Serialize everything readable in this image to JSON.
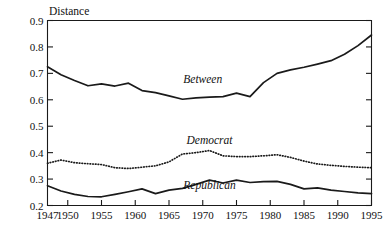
{
  "chart_data": {
    "type": "line",
    "title": "",
    "xlabel": "",
    "ylabel": "Distance",
    "xlim": [
      1947,
      1995
    ],
    "ylim": [
      0.2,
      0.9
    ],
    "grid": false,
    "legend_position": "inline-annotations",
    "x_ticks": [
      1947,
      1950,
      1955,
      1960,
      1965,
      1970,
      1975,
      1980,
      1985,
      1990,
      1995
    ],
    "x_tick_labels": [
      "1947",
      "1950",
      "1955",
      "1960",
      "1965",
      "1970",
      "1975",
      "1980",
      "1985",
      "1990",
      "1995"
    ],
    "y_ticks": [
      0.2,
      0.3,
      0.4,
      0.5,
      0.6,
      0.7,
      0.8,
      0.9
    ],
    "y_tick_labels": [
      "0.2",
      "0.3",
      "0.4",
      "0.5",
      "0.6",
      "0.7",
      "0.8",
      "0.9"
    ],
    "x": [
      1947,
      1949,
      1951,
      1953,
      1955,
      1957,
      1959,
      1961,
      1963,
      1965,
      1967,
      1969,
      1971,
      1973,
      1975,
      1977,
      1979,
      1981,
      1983,
      1985,
      1987,
      1989,
      1991,
      1993,
      1995
    ],
    "series": [
      {
        "name": "Between",
        "style": "solid",
        "color": "#1a1a1a",
        "label_x": 1970,
        "label_y": 0.665,
        "values": [
          0.725,
          0.695,
          0.673,
          0.653,
          0.66,
          0.652,
          0.663,
          0.635,
          0.627,
          0.615,
          0.602,
          0.607,
          0.61,
          0.612,
          0.625,
          0.612,
          0.665,
          0.7,
          0.713,
          0.723,
          0.735,
          0.748,
          0.772,
          0.805,
          0.845
        ]
      },
      {
        "name": "Democrat",
        "style": "dotted",
        "color": "#1a1a1a",
        "label_x": 1971,
        "label_y": 0.432,
        "values": [
          0.36,
          0.372,
          0.362,
          0.358,
          0.355,
          0.343,
          0.34,
          0.345,
          0.35,
          0.365,
          0.395,
          0.4,
          0.408,
          0.388,
          0.385,
          0.385,
          0.388,
          0.392,
          0.382,
          0.368,
          0.357,
          0.352,
          0.348,
          0.345,
          0.343
        ]
      },
      {
        "name": "Republican",
        "style": "solid",
        "color": "#1a1a1a",
        "label_x": 1971,
        "label_y": 0.262,
        "values": [
          0.275,
          0.255,
          0.242,
          0.234,
          0.233,
          0.242,
          0.252,
          0.263,
          0.245,
          0.258,
          0.265,
          0.28,
          0.296,
          0.285,
          0.296,
          0.287,
          0.29,
          0.291,
          0.28,
          0.263,
          0.267,
          0.258,
          0.253,
          0.248,
          0.245
        ]
      }
    ]
  },
  "axis": {
    "y_title": "Distance"
  }
}
